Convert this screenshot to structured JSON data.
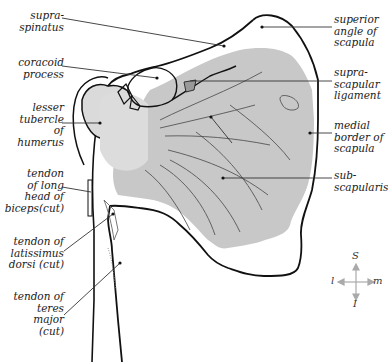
{
  "diagram": {
    "colors": {
      "muscle_fill": "#c8c8c8",
      "tubercle_fill": "#dadada",
      "outline": "#111111",
      "leader": "#333333",
      "compass": "#aaaaaa"
    },
    "labels_left": [
      {
        "id": "supraspinatus",
        "text": "supra-\nspinatus"
      },
      {
        "id": "coracoid-process",
        "text": "coracoid\nprocess"
      },
      {
        "id": "lesser-tubercle",
        "text": "lesser\ntubercle\nof\nhumerus"
      },
      {
        "id": "biceps-tendon",
        "text": "tendon\nof long\nhead of\nbiceps(cut)"
      },
      {
        "id": "latissimus-tendon",
        "text": "tendon of\nlatissimus\ndorsi (cut)"
      },
      {
        "id": "teres-major-tendon",
        "text": "tendon of\nteres\nmajor\n(cut)"
      }
    ],
    "labels_right": [
      {
        "id": "superior-angle",
        "text": "superior\nangle of\nscapula"
      },
      {
        "id": "suprascapular-ligament",
        "text": "supra-\nscapular\nligament"
      },
      {
        "id": "medial-border",
        "text": "medial\nborder of\nscapula"
      },
      {
        "id": "subscapularis",
        "text": "sub-\nscapularis"
      }
    ],
    "compass": {
      "top": "S",
      "bottom": "I",
      "left": "l",
      "right": "m"
    }
  }
}
